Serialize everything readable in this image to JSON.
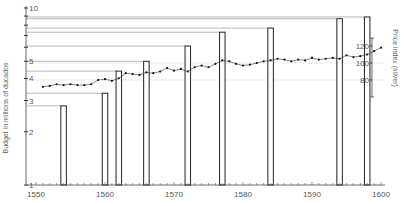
{
  "chart_data": {
    "type": "bar",
    "title": "",
    "xlabel": "",
    "ylabel": "Budget in millions of ducados",
    "y_scale": "log",
    "ylim": [
      1,
      10
    ],
    "xlim": [
      1550,
      1601
    ],
    "x_ticks": [
      1550,
      1560,
      1570,
      1580,
      1590,
      1600
    ],
    "y_ticks": [
      {
        "value": 1,
        "label": "1"
      },
      {
        "value": 2,
        "label": "2"
      },
      {
        "value": 3,
        "label": "3"
      },
      {
        "value": 4,
        "label": "4"
      },
      {
        "value": 5,
        "label": "5"
      },
      {
        "value": 6,
        "label": ""
      },
      {
        "value": 7,
        "label": ""
      },
      {
        "value": 8,
        "label": ""
      },
      {
        "value": 9,
        "label": ""
      },
      {
        "value": 10,
        "label": "10"
      }
    ],
    "bars": {
      "name": "Budget",
      "x": [
        1554,
        1560,
        1562,
        1566,
        1572,
        1577,
        1584,
        1594,
        1598
      ],
      "values": [
        2.8,
        3.3,
        4.4,
        5.0,
        6.1,
        7.3,
        7.7,
        8.7,
        8.9
      ]
    },
    "secondary_axis": {
      "label": "Price index (silver)",
      "ticks": [
        80,
        100,
        120
      ],
      "range": [
        60,
        140
      ]
    },
    "line": {
      "name": "Price index (silver)",
      "x": [
        1551,
        1552,
        1553,
        1554,
        1555,
        1556,
        1557,
        1558,
        1559,
        1560,
        1561,
        1562,
        1563,
        1564,
        1565,
        1566,
        1567,
        1568,
        1569,
        1570,
        1571,
        1572,
        1573,
        1574,
        1575,
        1576,
        1577,
        1578,
        1579,
        1580,
        1581,
        1582,
        1583,
        1584,
        1585,
        1586,
        1587,
        1588,
        1589,
        1590,
        1591,
        1592,
        1593,
        1594,
        1595,
        1596,
        1597,
        1598,
        1599,
        1600
      ],
      "values": [
        72,
        73,
        75,
        74,
        75,
        74,
        74,
        75,
        80,
        81,
        79,
        82,
        88,
        87,
        86,
        89,
        88,
        90,
        94,
        91,
        93,
        90,
        95,
        97,
        95,
        99,
        103,
        102,
        99,
        97,
        98,
        100,
        102,
        103,
        105,
        104,
        102,
        104,
        103,
        106,
        104,
        105,
        106,
        105,
        109,
        107,
        108,
        110,
        114,
        118
      ]
    },
    "faint_gridlines_price": [
      80,
      100
    ],
    "grid": false,
    "legend": "none"
  }
}
